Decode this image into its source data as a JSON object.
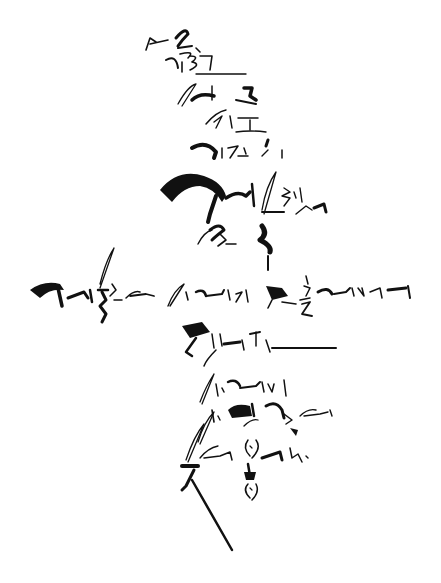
{
  "artwork": {
    "type": "korean-calligraphy",
    "background": "#ffffff",
    "ink": "#111111",
    "layout": "cross-shaped vertical composition with a horizontal line crossing the middle"
  }
}
